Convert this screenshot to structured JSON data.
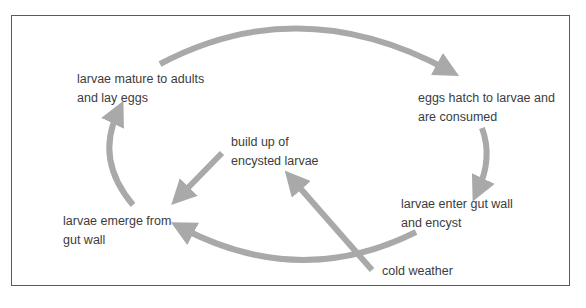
{
  "diagram": {
    "type": "life-cycle",
    "colors": {
      "arrow": "#a9a9a9",
      "text": "#3c3c3c",
      "border": "#5a5a5a"
    },
    "nodes": [
      {
        "id": "mature",
        "text": "larvae mature to adults\nand lay eggs"
      },
      {
        "id": "hatch",
        "text": "eggs hatch to larvae and\nare consumed"
      },
      {
        "id": "enter",
        "text": "larvae enter gut wall\nand encyst"
      },
      {
        "id": "emerge",
        "text": "larvae emerge from\ngut wall"
      },
      {
        "id": "buildup",
        "text": "build up of\nencysted larvae"
      },
      {
        "id": "cold",
        "text": "cold weather"
      }
    ],
    "edges": [
      {
        "from": "mature",
        "to": "hatch"
      },
      {
        "from": "hatch",
        "to": "enter"
      },
      {
        "from": "enter",
        "to": "emerge"
      },
      {
        "from": "emerge",
        "to": "mature"
      },
      {
        "from": "buildup",
        "to": "emerge"
      },
      {
        "from": "cold",
        "to": "buildup"
      }
    ]
  }
}
